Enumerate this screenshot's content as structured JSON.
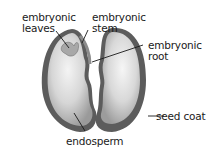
{
  "diagram": {
    "labels": {
      "embryonic_leaves": [
        "embryonic",
        "leaves"
      ],
      "embryonic_stem": [
        "embryonic",
        "stem"
      ],
      "embryonic_root": [
        "embryonic",
        "root"
      ],
      "seed_coat": "seed coat",
      "endosperm": "endosperm"
    },
    "colors": {
      "seed_coat": "#5a5a5a",
      "endosperm_light": "#f2f2f2",
      "endosperm_mid": "#c4c4c4",
      "leader_line": "#1a1a1a"
    }
  }
}
